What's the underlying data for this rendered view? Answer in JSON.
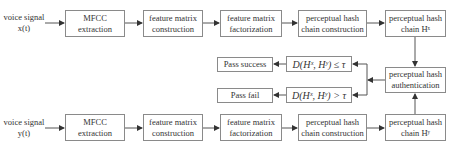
{
  "diagram": {
    "row_x": {
      "input": [
        "voice signal",
        "x(t)"
      ],
      "mfcc": [
        "MFCC",
        "extraction"
      ],
      "fm_construction": [
        "feature matrix",
        "construction"
      ],
      "fm_factorization": [
        "feature matrix",
        "factorization"
      ],
      "phc_construction": [
        "perceptual hash",
        "chain construction"
      ],
      "phc_output": [
        "perceptual hash",
        "chain Hˣ"
      ]
    },
    "row_y": {
      "input": [
        "voice signal",
        "y(t)"
      ],
      "mfcc": [
        "MFCC",
        "extraction"
      ],
      "fm_construction": [
        "feature matrix",
        "construction"
      ],
      "fm_factorization": [
        "feature matrix",
        "factorization"
      ],
      "phc_construction": [
        "perceptual hash",
        "chain construction"
      ],
      "phc_output": [
        "perceptual hash",
        "chain Hʸ"
      ]
    },
    "authentication": [
      "perceptual hash",
      "authentication"
    ],
    "condition_pass": "D(Hˣ, Hʸ) ≤ τ",
    "condition_fail": "D(Hˣ, Hʸ) > τ",
    "result_pass": "Pass success",
    "result_fail": "Pass fail"
  },
  "colors": {
    "border": "#8a8a8a",
    "line": "#555555",
    "text": "#333333"
  }
}
